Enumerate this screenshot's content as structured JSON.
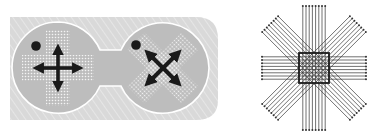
{
  "figure": {
    "width": 369,
    "height": 136,
    "background": "#ffffff"
  },
  "panel_left": {
    "label": "",
    "panel_color": "#d9d9d9",
    "hatch_color": "#e8e8e8",
    "lobe_color": "#bdbdbd",
    "outline_color": "#ffffff",
    "dot_color": "#f4f4f4",
    "glyph_color": "#1a1a1a",
    "lobes": [
      {
        "name": "orthogonal",
        "cx": 58,
        "cy": 68,
        "r": 46,
        "pattern": "plus",
        "arrows": "four-way-orthogonal"
      },
      {
        "name": "diagonal",
        "cx": 163,
        "cy": 68,
        "r": 46,
        "pattern": "x",
        "arrows": "four-way-diagonal"
      }
    ]
  },
  "panel_right": {
    "label": "",
    "line_color": "#333333",
    "square_color": "#1a1a1a",
    "center": [
      314,
      68
    ],
    "lines_per_bundle": 8,
    "bundles": [
      "vertical",
      "horizontal",
      "diagonal-ne",
      "diagonal-nw"
    ]
  }
}
